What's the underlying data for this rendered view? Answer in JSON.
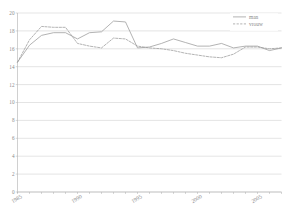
{
  "chart_data": {
    "type": "line",
    "title": "",
    "subtitle": "",
    "xlabel": "",
    "ylabel": "",
    "xlim": [
      1985,
      2007
    ],
    "ylim": [
      0,
      20
    ],
    "grid": true,
    "legend_position": "top-right",
    "y_ticks": [
      0,
      2,
      4,
      6,
      8,
      10,
      12,
      14,
      16,
      18,
      20
    ],
    "y_tick_labels": [
      "0",
      "2",
      "4",
      "6",
      "8",
      "10",
      "12",
      "14",
      "16",
      "18",
      "20"
    ],
    "x_ticks": [
      1985,
      1986,
      1987,
      1988,
      1989,
      1990,
      1991,
      1992,
      1993,
      1994,
      1995,
      1996,
      1997,
      1998,
      1999,
      2000,
      2001,
      2002,
      2003,
      2004,
      2005,
      2006,
      2007
    ],
    "x_tick_labels_shown": [
      "1985",
      "1990",
      "1995",
      "2000",
      "2005"
    ],
    "x_tick_label_years": [
      1985,
      1990,
      1995,
      2000,
      2005
    ],
    "x": [
      1985,
      1986,
      1987,
      1988,
      1989,
      1990,
      1991,
      1992,
      1993,
      1994,
      1995,
      1996,
      1997,
      1998,
      1999,
      2000,
      2001,
      2002,
      2003,
      2004,
      2005,
      2006,
      2007
    ],
    "series": [
      {
        "name": "man",
        "style": "solid",
        "color": "#9a9a9a",
        "values": [
          14.5,
          16.4,
          17.5,
          17.8,
          17.8,
          17.1,
          17.8,
          17.9,
          19.1,
          19.0,
          16.1,
          16.2,
          16.6,
          17.1,
          16.7,
          16.3,
          16.3,
          16.6,
          16.1,
          16.3,
          16.3,
          15.8,
          16.1
        ]
      },
      {
        "name": "vrouw",
        "style": "dashed",
        "color": "#9a9a9a",
        "values": [
          14.5,
          17.0,
          18.5,
          18.4,
          18.4,
          16.6,
          16.3,
          16.1,
          17.2,
          17.1,
          16.3,
          16.1,
          16.0,
          15.8,
          15.5,
          15.3,
          15.1,
          15.0,
          15.4,
          16.2,
          16.2,
          16.0,
          16.1
        ]
      }
    ],
    "legend": [
      {
        "label": "man",
        "style": "solid",
        "color": "#9a9a9a"
      },
      {
        "label": "vrouw",
        "style": "dashed",
        "color": "#9a9a9a"
      }
    ],
    "colors": {
      "grid": "#c8c8c8",
      "axis": "#b0b0b0",
      "text": "#8a8a8a",
      "background": "#ffffff",
      "series_man": "#9a9a9a",
      "series_vrouw": "#9a9a9a"
    }
  }
}
